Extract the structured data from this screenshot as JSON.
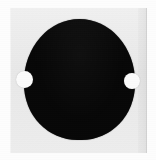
{
  "image": {
    "subject": "black circular disc on light gray square plate",
    "kind": "grayscale-photograph",
    "width": 156,
    "height": 160
  },
  "colors": {
    "background": "#fdfdfd",
    "plate": "#eaeaea",
    "disc": "#070707",
    "dot": "#fbfbfb"
  },
  "plate": {
    "label": "square substrate plate",
    "left": 10,
    "top": 8,
    "width": 137,
    "height": 145
  },
  "disc": {
    "label": "black disc",
    "left": 24,
    "top": 19,
    "width": 111,
    "height": 121
  },
  "markers": [
    {
      "label": "left white dot",
      "left": 16,
      "top": 71,
      "diameter": 17
    },
    {
      "label": "right white dot",
      "left": 124,
      "top": 73,
      "diameter": 16
    }
  ]
}
